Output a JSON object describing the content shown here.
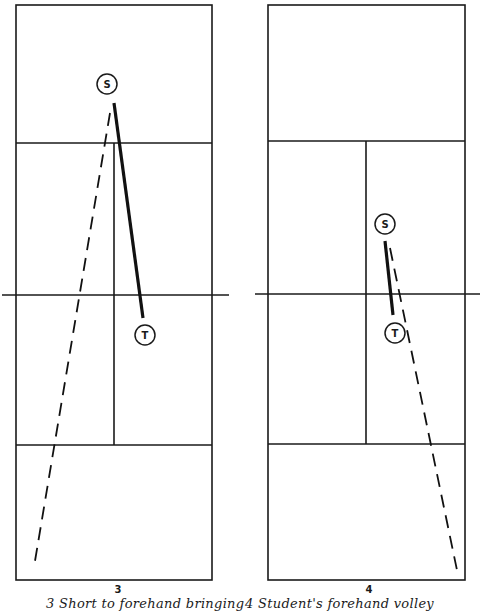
{
  "figures": [
    {
      "number": "3",
      "caption": "3   Short   to   forehand   bringing",
      "players": [
        {
          "id": "S",
          "label": "S"
        },
        {
          "id": "T",
          "label": "T"
        }
      ]
    },
    {
      "number": "4",
      "caption": "4  Student's forehand volley",
      "players": [
        {
          "id": "S",
          "label": "S"
        },
        {
          "id": "T",
          "label": "T"
        }
      ]
    }
  ],
  "colors": {
    "ink": "#1a1a1a",
    "background": "#ffffff"
  }
}
